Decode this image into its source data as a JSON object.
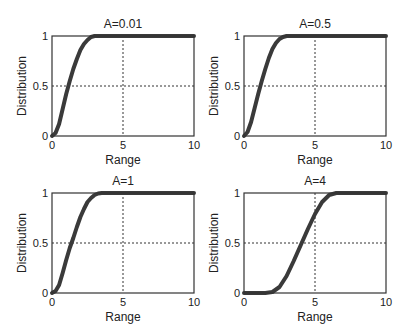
{
  "chart_data": [
    {
      "type": "line",
      "title": "A=0.01",
      "xlabel": "Range",
      "ylabel": "Distribution",
      "xlim": [
        0,
        10
      ],
      "ylim": [
        0,
        1
      ],
      "xticks": [
        0,
        5,
        10
      ],
      "yticks": [
        0,
        0.5,
        1
      ],
      "grid": "dashed at x=5, y=0.5",
      "x": [
        0,
        0.25,
        0.5,
        0.75,
        1.0,
        1.25,
        1.5,
        1.75,
        2.0,
        2.25,
        2.5,
        2.75,
        3.0,
        3.5,
        4,
        5,
        6,
        7,
        8,
        9,
        10
      ],
      "values": [
        0,
        0.03,
        0.12,
        0.27,
        0.42,
        0.55,
        0.67,
        0.77,
        0.86,
        0.92,
        0.96,
        0.99,
        1.0,
        1,
        1,
        1,
        1,
        1,
        1,
        1,
        1
      ]
    },
    {
      "type": "line",
      "title": "A=0.5",
      "xlabel": "Range",
      "ylabel": "Distribution",
      "xlim": [
        0,
        10
      ],
      "ylim": [
        0,
        1
      ],
      "xticks": [
        0,
        5,
        10
      ],
      "yticks": [
        0,
        0.5,
        1
      ],
      "grid": "dashed at x=5, y=0.5",
      "x": [
        0,
        0.25,
        0.5,
        0.75,
        1.0,
        1.25,
        1.5,
        1.75,
        2.0,
        2.25,
        2.5,
        2.75,
        3.0,
        3.5,
        4,
        5,
        6,
        7,
        8,
        9,
        10
      ],
      "values": [
        0,
        0.04,
        0.14,
        0.28,
        0.42,
        0.55,
        0.67,
        0.78,
        0.87,
        0.93,
        0.97,
        0.99,
        1.0,
        1,
        1,
        1,
        1,
        1,
        1,
        1,
        1
      ]
    },
    {
      "type": "line",
      "title": "A=1",
      "xlabel": "Range",
      "ylabel": "Distribution",
      "xlim": [
        0,
        10
      ],
      "ylim": [
        0,
        1
      ],
      "xticks": [
        0,
        5,
        10
      ],
      "yticks": [
        0,
        0.5,
        1
      ],
      "grid": "dashed at x=5, y=0.5",
      "x": [
        0,
        0.25,
        0.5,
        0.75,
        1.0,
        1.25,
        1.5,
        1.75,
        2.0,
        2.25,
        2.5,
        2.75,
        3.0,
        3.25,
        3.5,
        4,
        5,
        6,
        7,
        8,
        9,
        10
      ],
      "values": [
        0,
        0.02,
        0.08,
        0.2,
        0.33,
        0.45,
        0.55,
        0.66,
        0.76,
        0.84,
        0.91,
        0.95,
        0.98,
        0.995,
        1.0,
        1,
        1,
        1,
        1,
        1,
        1,
        1
      ]
    },
    {
      "type": "line",
      "title": "A=4",
      "xlabel": "Range",
      "ylabel": "Distribution",
      "xlim": [
        0,
        10
      ],
      "ylim": [
        0,
        1
      ],
      "xticks": [
        0,
        5,
        10
      ],
      "yticks": [
        0,
        0.5,
        1
      ],
      "grid": "dashed at x=5, y=0.5",
      "x": [
        0,
        1,
        1.5,
        2.0,
        2.5,
        3.0,
        3.5,
        4.0,
        4.5,
        5.0,
        5.5,
        6.0,
        6.5,
        7,
        8,
        9,
        10
      ],
      "values": [
        0,
        0,
        0,
        0.01,
        0.06,
        0.17,
        0.32,
        0.48,
        0.64,
        0.79,
        0.91,
        0.98,
        1.0,
        1,
        1,
        1,
        1
      ]
    }
  ],
  "panels": [
    {
      "title": "A=0.01",
      "xlabel": "Range",
      "ylabel": "Distribution"
    },
    {
      "title": "A=0.5",
      "xlabel": "Range",
      "ylabel": "Distribution"
    },
    {
      "title": "A=1",
      "xlabel": "Range",
      "ylabel": "Distribution"
    },
    {
      "title": "A=4",
      "xlabel": "Range",
      "ylabel": "Distribution"
    }
  ],
  "tick_labels": {
    "x": [
      "0",
      "5",
      "10"
    ],
    "y": [
      "0",
      "0.5",
      "1"
    ]
  },
  "colors": {
    "curve": "#3a3a3a",
    "axes": "#333333",
    "grid": "#333333",
    "background": "#ffffff"
  }
}
